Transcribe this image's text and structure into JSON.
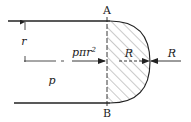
{
  "diagram": {
    "labels": {
      "point_top": "A",
      "point_bottom": "B",
      "radius": "r",
      "pressure": "p",
      "pressure_force_base": "pπr",
      "pressure_force_exp": "2",
      "reaction_inner": "R",
      "reaction_outer": "R"
    },
    "colors": {
      "stroke": "#222222",
      "hatch": "#555555",
      "background": "#ffffff"
    }
  }
}
